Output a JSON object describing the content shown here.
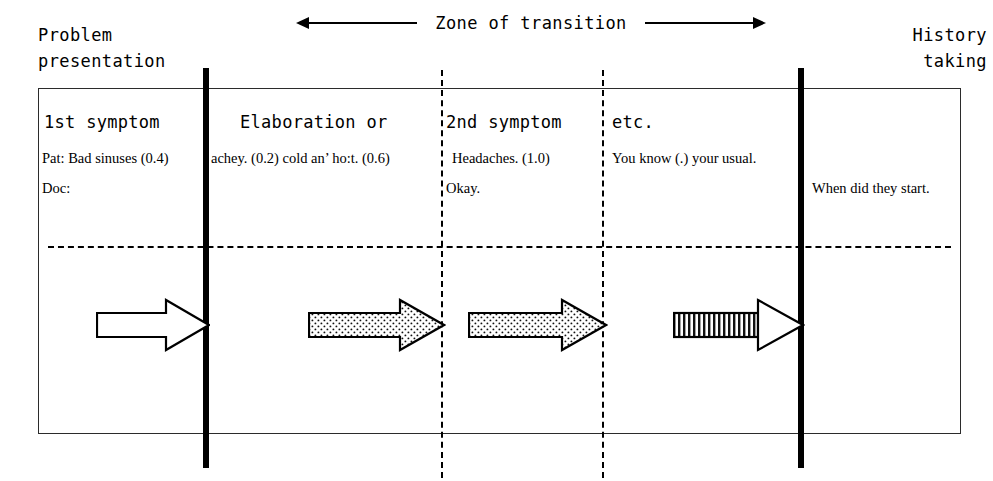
{
  "diagram": {
    "title_left": "Problem\npresentation",
    "title_right": "History\ntaking",
    "zone_label": "Zone of transition",
    "columns": [
      {
        "heading": "1st symptom",
        "patient_line": "Pat: Bad sinuses (0.4)",
        "doctor_line": "Doc:"
      },
      {
        "heading": "Elaboration or",
        "patient_line": "achey. (0.2) cold an’ ho:t. (0.6)",
        "doctor_line": ""
      },
      {
        "heading": "2nd symptom",
        "patient_line": "Headaches. (1.0)",
        "doctor_line": "Okay."
      },
      {
        "heading": "etc.",
        "patient_line": "You know (.) your usual.",
        "doctor_line": ""
      },
      {
        "heading": "",
        "patient_line": "",
        "doctor_line": "When did they start."
      }
    ],
    "arrows": [
      {
        "name": "arrow-phase-1",
        "fill": "none"
      },
      {
        "name": "arrow-phase-2",
        "fill": "stippled"
      },
      {
        "name": "arrow-phase-3",
        "fill": "stippled"
      },
      {
        "name": "arrow-phase-4",
        "fill": "striped"
      }
    ],
    "colors": {
      "ink": "#000000",
      "box_border": "#2b2b2b",
      "background": "#ffffff",
      "stipple": "#f2f2f2"
    }
  }
}
